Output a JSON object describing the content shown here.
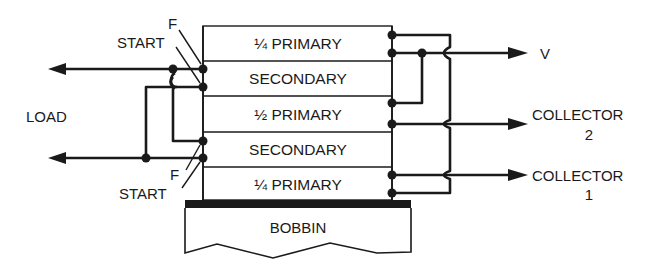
{
  "diagram": {
    "type": "transformer-winding-cross-section",
    "coil_layers": [
      {
        "label": "¼ PRIMARY"
      },
      {
        "label": "SECONDARY"
      },
      {
        "label": "½ PRIMARY"
      },
      {
        "label": "SECONDARY"
      },
      {
        "label": "¼ PRIMARY"
      }
    ],
    "bobbin": {
      "label": "BOBBIN"
    },
    "left": {
      "load_label": "LOAD",
      "top_finish_label": "F",
      "top_start_label": "START",
      "bottom_finish_label": "F",
      "bottom_start_label": "START"
    },
    "right": {
      "v_label": "V",
      "collector2_line1": "COLLECTOR",
      "collector2_line2": "2",
      "collector1_line1": "COLLECTOR",
      "collector1_line2": "1"
    },
    "colors": {
      "ink": "#1a1a1a",
      "background": "#ffffff"
    }
  }
}
